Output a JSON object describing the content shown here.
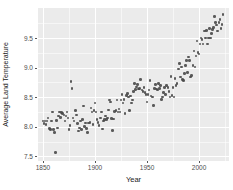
{
  "chart_data": {
    "type": "scatter",
    "title": "",
    "xlabel": "Year",
    "ylabel": "Average Land Temperature",
    "xlim": [
      1845.2,
      2028.8
    ],
    "ylim": [
      7.42,
      10.01
    ],
    "xticks": [
      1850,
      1900,
      1950,
      2000
    ],
    "yticks": [
      7.5,
      8.0,
      8.5,
      9.0,
      9.5
    ],
    "xticks_minor": [
      1875,
      1925,
      1975,
      2025
    ],
    "yticks_minor": [
      7.75,
      8.25,
      8.75,
      9.25,
      9.75
    ],
    "grid": true,
    "legend_position": "none",
    "panel_background": "#ebebeb",
    "gridline_color": "#ffffff",
    "point_color": "#454545",
    "tick_label_color": "#4d4d4d",
    "series": [
      {
        "name": "yearly-average-land-temperature",
        "x": [
          1850,
          1851,
          1852,
          1853,
          1854,
          1855,
          1856,
          1857,
          1858,
          1859,
          1860,
          1861,
          1862,
          1863,
          1864,
          1865,
          1866,
          1867,
          1868,
          1869,
          1870,
          1871,
          1872,
          1873,
          1874,
          1875,
          1876,
          1877,
          1878,
          1879,
          1880,
          1881,
          1882,
          1883,
          1884,
          1885,
          1886,
          1887,
          1888,
          1889,
          1890,
          1891,
          1892,
          1893,
          1894,
          1895,
          1896,
          1897,
          1898,
          1899,
          1900,
          1901,
          1902,
          1903,
          1904,
          1905,
          1906,
          1907,
          1908,
          1909,
          1910,
          1911,
          1912,
          1913,
          1914,
          1915,
          1916,
          1917,
          1918,
          1919,
          1920,
          1921,
          1922,
          1923,
          1924,
          1925,
          1926,
          1927,
          1928,
          1929,
          1930,
          1931,
          1932,
          1933,
          1934,
          1935,
          1936,
          1937,
          1938,
          1939,
          1940,
          1941,
          1942,
          1943,
          1944,
          1945,
          1946,
          1947,
          1948,
          1949,
          1950,
          1951,
          1952,
          1953,
          1954,
          1955,
          1956,
          1957,
          1958,
          1959,
          1960,
          1961,
          1962,
          1963,
          1964,
          1965,
          1966,
          1967,
          1968,
          1969,
          1970,
          1971,
          1972,
          1973,
          1974,
          1975,
          1976,
          1977,
          1978,
          1979,
          1980,
          1981,
          1982,
          1983,
          1984,
          1985,
          1986,
          1987,
          1988,
          1989,
          1990,
          1991,
          1992,
          1993,
          1994,
          1995,
          1996,
          1997,
          1998,
          1999,
          2000,
          2001,
          2002,
          2003,
          2004,
          2005,
          2006,
          2007,
          2008,
          2009,
          2010,
          2011,
          2012,
          2013,
          2014,
          2015,
          2016,
          2017,
          2018,
          2019,
          2020,
          2021,
          2022,
          2023
        ],
        "y": [
          8.1,
          8.05,
          8.1,
          8.04,
          8.1,
          8.15,
          7.97,
          7.95,
          8.1,
          8.25,
          7.95,
          7.9,
          7.56,
          8.11,
          7.98,
          8.18,
          8.25,
          8.16,
          8.24,
          8.22,
          8.2,
          8.1,
          8.18,
          8.25,
          8.15,
          7.95,
          8.02,
          8.77,
          8.65,
          8.15,
          8.1,
          8.27,
          8.2,
          8.05,
          7.93,
          7.98,
          8.1,
          7.95,
          8.12,
          8.35,
          8.0,
          8.06,
          7.97,
          7.9,
          8.06,
          8.07,
          8.32,
          8.25,
          8.04,
          8.27,
          8.4,
          8.25,
          8.12,
          8.07,
          8.02,
          8.15,
          8.25,
          7.96,
          8.1,
          8.12,
          8.18,
          8.12,
          8.15,
          8.28,
          8.45,
          8.42,
          8.14,
          7.94,
          8.13,
          8.26,
          8.27,
          8.45,
          8.25,
          8.3,
          8.25,
          8.45,
          8.55,
          8.4,
          8.46,
          8.22,
          8.53,
          8.56,
          8.5,
          8.27,
          8.52,
          8.4,
          8.45,
          8.6,
          8.73,
          8.63,
          8.67,
          8.72,
          8.64,
          8.65,
          8.8,
          8.62,
          8.6,
          8.66,
          8.58,
          8.55,
          8.42,
          8.55,
          8.62,
          8.78,
          8.52,
          8.5,
          8.36,
          8.65,
          8.72,
          8.64,
          8.62,
          8.73,
          8.65,
          8.7,
          8.46,
          8.5,
          8.58,
          8.66,
          8.55,
          8.7,
          8.66,
          8.6,
          8.5,
          8.85,
          8.53,
          8.66,
          8.5,
          8.82,
          8.7,
          8.73,
          8.98,
          9.07,
          8.84,
          9.01,
          8.8,
          8.78,
          8.9,
          9.04,
          9.12,
          8.92,
          9.18,
          9.12,
          8.84,
          8.87,
          9.04,
          9.28,
          9.01,
          9.2,
          9.45,
          9.26,
          9.23,
          9.4,
          9.5,
          9.48,
          9.4,
          9.62,
          9.5,
          9.63,
          9.4,
          9.5,
          9.66,
          9.5,
          9.58,
          9.65,
          9.68,
          9.87,
          9.76,
          9.72,
          9.62,
          9.76,
          9.82,
          9.66,
          9.73,
          9.9
        ]
      }
    ]
  }
}
